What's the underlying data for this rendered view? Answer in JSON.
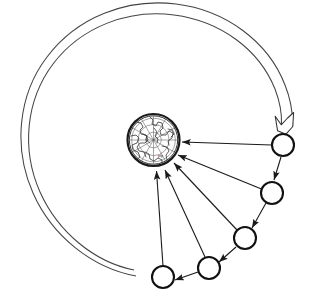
{
  "figure": {
    "background_color": "#ffffff",
    "line_color": "#1a1a1a",
    "orbit_color": "#444444",
    "width": 309,
    "height": 301
  },
  "earth": {
    "name": "earth-globe",
    "label": "Earth",
    "projection": "polar-azimuthal",
    "center": {
      "x": 153.5,
      "y": 140
    },
    "radius": 26,
    "rim_width": 2.2,
    "graticule": {
      "meridian_count": 12,
      "parallel_count": 3,
      "color": "#5a5a5a"
    },
    "map_text": "ply"
  },
  "satellites": [
    {
      "name": "satellite-1",
      "label": "1",
      "cx": 283,
      "cy": 145,
      "r": 11
    },
    {
      "name": "satellite-2",
      "label": "2",
      "cx": 272,
      "cy": 193,
      "r": 11
    },
    {
      "name": "satellite-3",
      "label": "3",
      "cx": 245,
      "cy": 238,
      "r": 11
    },
    {
      "name": "satellite-4",
      "label": "4",
      "cx": 209,
      "cy": 268,
      "r": 11
    },
    {
      "name": "satellite-5",
      "label": "5",
      "cx": 163,
      "cy": 277,
      "r": 11
    }
  ],
  "downlinks": [
    {
      "name": "downlink-1",
      "from": "satellite-1",
      "to": "earth-globe"
    },
    {
      "name": "downlink-2",
      "from": "satellite-2",
      "to": "earth-globe"
    },
    {
      "name": "downlink-3",
      "from": "satellite-3",
      "to": "earth-globe"
    },
    {
      "name": "downlink-4",
      "from": "satellite-4",
      "to": "earth-globe"
    },
    {
      "name": "downlink-5",
      "from": "satellite-5",
      "to": "earth-globe"
    }
  ],
  "crosslinks": [
    {
      "name": "crosslink-1-2",
      "from": "satellite-1",
      "to": "satellite-2"
    },
    {
      "name": "crosslink-2-3",
      "from": "satellite-2",
      "to": "satellite-3"
    },
    {
      "name": "crosslink-3-4",
      "from": "satellite-3",
      "to": "satellite-4"
    },
    {
      "name": "crosslink-4-5",
      "from": "satellite-4",
      "to": "satellite-5"
    }
  ],
  "orbit_arc": {
    "name": "orbit-arc",
    "style": "double-line-outline",
    "direction": "clockwise",
    "arrowhead": "hollow",
    "start": {
      "x": 135,
      "y": 274
    },
    "end": {
      "x": 283,
      "y": 128
    }
  }
}
